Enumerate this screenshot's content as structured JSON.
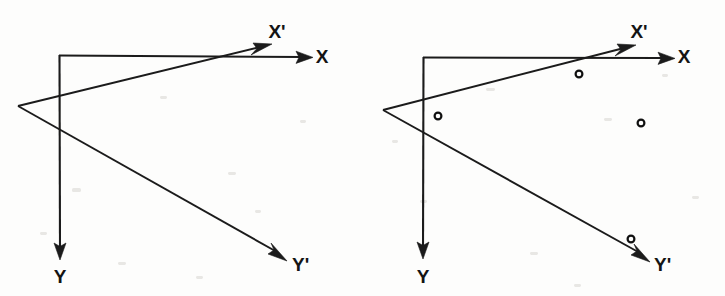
{
  "figure": {
    "background_color": "#fdfdfc",
    "line_color": "#1b1b1b",
    "marker_color": "#101010",
    "panel_count": 2
  },
  "panels": [
    {
      "id": "panel-left",
      "name": "coordinate-frames-no-points",
      "caption": "",
      "axes": [
        {
          "id": "axis-x",
          "label": "X",
          "label_x": 322,
          "label_y": 63,
          "origin": {
            "x": 59,
            "y": 55
          },
          "tip": {
            "x": 313,
            "y": 57
          },
          "kind": "original-horizontal"
        },
        {
          "id": "axis-y",
          "label": "Y",
          "label_x": 60,
          "label_y": 283,
          "origin": {
            "x": 59,
            "y": 55
          },
          "tip": {
            "x": 60,
            "y": 260
          },
          "kind": "original-vertical"
        },
        {
          "id": "axis-x-prime",
          "label": "X'",
          "label_x": 277,
          "label_y": 38,
          "origin": {
            "x": 18,
            "y": 106
          },
          "tip": {
            "x": 272,
            "y": 45
          },
          "kind": "rotated-horizontal"
        },
        {
          "id": "axis-y-prime",
          "label": "Y'",
          "label_x": 292,
          "label_y": 271,
          "origin": {
            "x": 18,
            "y": 106
          },
          "tip": {
            "x": 287,
            "y": 261
          },
          "kind": "rotated-vertical"
        }
      ],
      "points": []
    },
    {
      "id": "panel-right",
      "name": "coordinate-frames-with-points",
      "caption": "",
      "axes": [
        {
          "id": "axis-x",
          "label": "X",
          "label_x": 322,
          "label_y": 63,
          "origin": {
            "x": 61,
            "y": 57
          },
          "tip": {
            "x": 313,
            "y": 58
          },
          "kind": "original-horizontal"
        },
        {
          "id": "axis-y",
          "label": "Y",
          "label_x": 61,
          "label_y": 283,
          "origin": {
            "x": 61,
            "y": 57
          },
          "tip": {
            "x": 61,
            "y": 259
          },
          "kind": "original-vertical"
        },
        {
          "id": "axis-x-prime",
          "label": "X'",
          "label_x": 277,
          "label_y": 38,
          "origin": {
            "x": 21,
            "y": 110
          },
          "tip": {
            "x": 274,
            "y": 46
          },
          "kind": "rotated-horizontal"
        },
        {
          "id": "axis-y-prime",
          "label": "Y'",
          "label_x": 292,
          "label_y": 271,
          "origin": {
            "x": 21,
            "y": 110
          },
          "tip": {
            "x": 288,
            "y": 262
          },
          "kind": "rotated-vertical"
        }
      ],
      "points": [
        {
          "id": "point-1",
          "x": 217,
          "y": 74,
          "r": 3.4
        },
        {
          "id": "point-2",
          "x": 76,
          "y": 116,
          "r": 3.4
        },
        {
          "id": "point-3",
          "x": 279,
          "y": 123,
          "r": 3.4
        },
        {
          "id": "point-4",
          "x": 269,
          "y": 239,
          "r": 3.4
        }
      ]
    }
  ],
  "labels": {
    "x": "X",
    "y": "Y",
    "x_prime": "X'",
    "y_prime": "Y'"
  }
}
